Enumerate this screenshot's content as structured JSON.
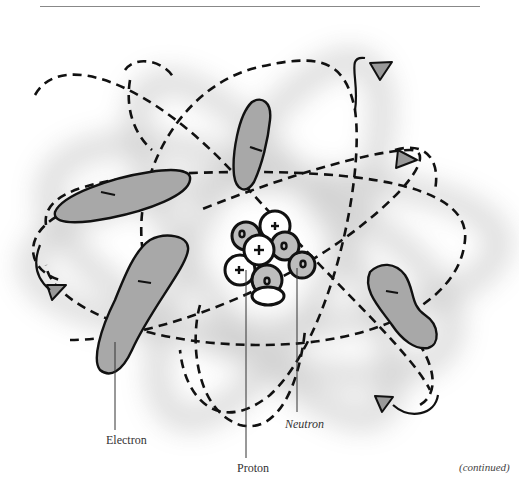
{
  "figure": {
    "labels": {
      "electron": "Electron",
      "proton": "Proton",
      "neutron": "Neutron",
      "continued": "(continued)"
    },
    "nucleus": {
      "protons_symbol": "+",
      "neutrons_symbol": "o"
    },
    "electron_symbol": "−",
    "colors": {
      "electron_fill": "#a8a8a8",
      "proton_fill": "#ffffff",
      "neutron_fill": "#bdbdbd",
      "outline": "#111111",
      "arrow_fill": "#999999",
      "rule": "#888888"
    }
  }
}
